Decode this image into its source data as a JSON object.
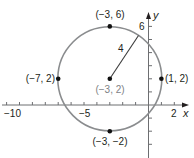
{
  "diagram": {
    "type": "circle-graph",
    "colors": {
      "circle": "#8a8c8e",
      "axis": "#6d6e71",
      "point": "#111111",
      "text": "#231f20",
      "center_label": "#808285"
    },
    "axes": {
      "x_label": "x",
      "y_label": "y",
      "x_ticks_labeled": [
        "−10",
        "−5",
        "2"
      ],
      "y_ticks_labeled": [
        "6"
      ],
      "x_range": [
        -11,
        3
      ],
      "y_range": [
        -3,
        7
      ]
    },
    "circle": {
      "center": [
        -3,
        2
      ],
      "radius": 4,
      "radius_label": "4"
    },
    "points": [
      {
        "label": "(−3, 6)",
        "x": -3,
        "y": 6
      },
      {
        "label": "(−7, 2)",
        "x": -7,
        "y": 2
      },
      {
        "label": "(1, 2)",
        "x": 1,
        "y": 2
      },
      {
        "label": "(−3, −2)",
        "x": -3,
        "y": -2
      },
      {
        "label": "(−3, 2)",
        "x": -3,
        "y": 2
      }
    ]
  }
}
